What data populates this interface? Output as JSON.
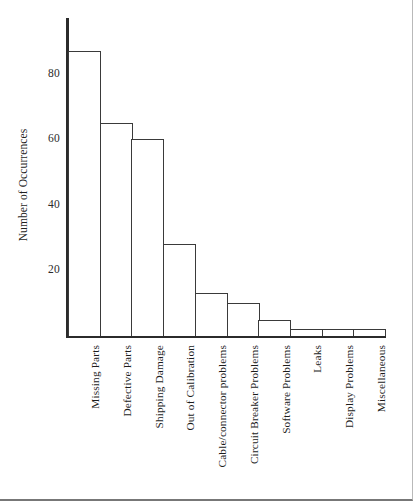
{
  "chart_data": {
    "type": "bar",
    "title": "",
    "subtitle": "",
    "xlabel": "",
    "ylabel": "Number of Occurrences",
    "ylim": [
      0,
      100
    ],
    "yticks": [
      20,
      40,
      60,
      80
    ],
    "ytick_labels": [
      "20",
      "40",
      "60",
      "80"
    ],
    "grid": false,
    "legend": false,
    "orientation": "vertical",
    "bar_style": "outline",
    "categories": [
      "Missing Parts",
      "Defective Parts",
      "Shipping Damage",
      "Out of Calibration",
      "Cable/connector problems",
      "Circuit Breaker Problems",
      "Software Problems",
      "Leaks",
      "Display Problems",
      "Miscellaneous"
    ],
    "values": [
      87,
      65,
      60,
      28,
      13,
      10,
      5,
      2,
      2,
      2
    ]
  },
  "axes": {
    "y_title": "Number of Occurrences",
    "y_tick_labels": [
      "80",
      "60",
      "40",
      "20"
    ]
  },
  "colors": {
    "axis": "#2b2b2b",
    "bar_outline": "#3a3a3a",
    "bar_fill": "#ffffff",
    "text": "#1c1c1c",
    "background": "#ffffff"
  }
}
